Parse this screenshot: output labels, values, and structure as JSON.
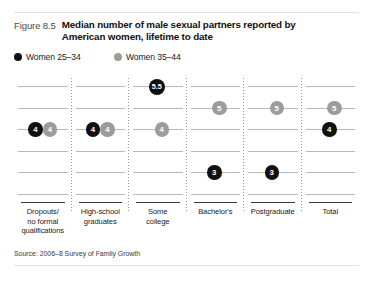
{
  "figure": {
    "number": "Figure 8.5",
    "title_line1": "Median number of male sexual partners reported by",
    "title_line2": "American women, lifetime to date",
    "source": "Source: 2006–8 Survey of Family Growth"
  },
  "colors": {
    "series_black": "#111111",
    "series_grey": "#9c9c9c",
    "gridline": "#b9b9b9",
    "separator": "#9a9a9a",
    "background": "#ffffff"
  },
  "legend": [
    {
      "label": "Women 25–34",
      "marker": "filled-circle-black",
      "color": "#111111"
    },
    {
      "label": "Women 35–44",
      "marker": "filled-circle-grey",
      "color": "#9c9c9c"
    }
  ],
  "chart_data": {
    "type": "scatter",
    "title": "Median number of male sexual partners reported by American women, lifetime to date",
    "xlabel": "",
    "ylabel": "",
    "grid": true,
    "legend_position": "top-left",
    "ylim": [
      1,
      6.5
    ],
    "categories": [
      "Dropouts/ no formal qualifications",
      "High-school graduates",
      "Some college",
      "Bachelor's",
      "Postgraduate",
      "Total"
    ],
    "category_lines": [
      [
        "Dropouts/",
        "no formal",
        "qualifications"
      ],
      [
        "High-school",
        "graduates"
      ],
      [
        "Some",
        "college"
      ],
      [
        "Bachelor's"
      ],
      [
        "Postgraduate"
      ],
      [
        "Total"
      ]
    ],
    "series": [
      {
        "name": "Women 25–34",
        "color": "#111111",
        "values": [
          4,
          4,
          5.5,
          3,
          3,
          4
        ],
        "labels": [
          "4",
          "4",
          "5.5",
          "3",
          "3",
          "4"
        ]
      },
      {
        "name": "Women 35–44",
        "color": "#9c9c9c",
        "values": [
          4,
          4,
          4,
          5,
          5,
          5
        ],
        "labels": [
          "4",
          "4",
          "4",
          "5",
          "5",
          "5"
        ]
      }
    ]
  }
}
